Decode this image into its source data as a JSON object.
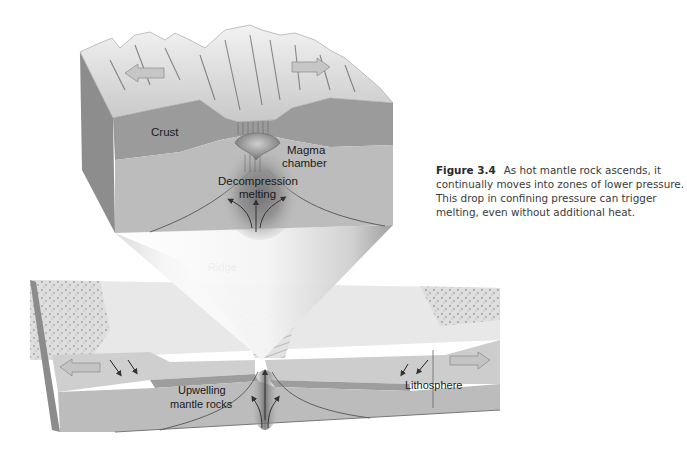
{
  "figure": {
    "number": "Figure 3.4",
    "caption": "As hot mantle rock ascends, it continually moves into zones of lower pressure. This drop in confining pressure can trigger melting, even without additional heat."
  },
  "top_block": {
    "labels": {
      "crust": "Crust",
      "magma_line1": "Magma",
      "magma_line2": "chamber",
      "decomp_line1": "Decompression",
      "decomp_line2": "melting"
    }
  },
  "bottom_block": {
    "labels": {
      "ridge": "Ridge",
      "upwelling_line1": "Upwelling",
      "upwelling_line2": "mantle rocks",
      "lithosphere": "Lithosphere"
    }
  },
  "colors": {
    "crust": "#9a9a9a",
    "mantle": "#bdbdbd",
    "side_face": "#8a8a8a",
    "surface": "#e6e6e6",
    "arrow_fill": "#c9c9c9",
    "text": "#1a1a1a"
  }
}
